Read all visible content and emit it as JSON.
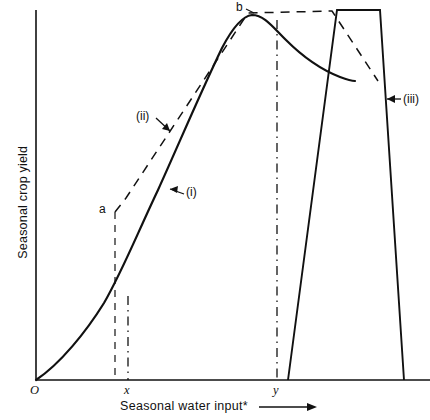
{
  "chart_data": {
    "type": "line",
    "title": "",
    "xlabel": "Seasonal water input*",
    "ylabel": "Seasonal crop yield",
    "grid": false,
    "legend": "none",
    "axes": {
      "origin_label": "O",
      "x_ticks": [
        "x",
        "y"
      ],
      "y_ticks": [],
      "xlim": [
        0,
        1
      ],
      "ylim": [
        0,
        1
      ],
      "x_arrow": true
    },
    "annotations": [
      {
        "id": "a",
        "label": "a",
        "note": "start of linear segment of curve (ii)"
      },
      {
        "id": "b",
        "label": "b",
        "note": "start of plateau of curve (ii)"
      },
      {
        "id": "i",
        "label": "(i)",
        "note": "solid sigmoid production function"
      },
      {
        "id": "ii",
        "label": "(ii)",
        "note": "dashed piecewise-linear approximation"
      },
      {
        "id": "iii",
        "label": "(iii)",
        "note": "solid trapezoidal block function"
      }
    ],
    "series": [
      {
        "name": "(i)",
        "style": "solid",
        "kind": "curve",
        "points": [
          [
            36,
            380
          ],
          [
            52,
            367
          ],
          [
            68,
            352
          ],
          [
            84,
            334
          ],
          [
            98,
            315
          ],
          [
            112,
            292
          ],
          [
            124,
            269
          ],
          [
            136,
            243
          ],
          [
            148,
            215
          ],
          [
            160,
            186
          ],
          [
            172,
            157
          ],
          [
            184,
            125
          ],
          [
            196,
            96
          ],
          [
            208,
            70
          ],
          [
            220,
            48
          ],
          [
            232,
            30
          ],
          [
            244,
            18
          ],
          [
            252,
            15
          ],
          [
            262,
            17
          ],
          [
            272,
            24
          ],
          [
            284,
            36
          ],
          [
            296,
            50
          ],
          [
            308,
            62
          ],
          [
            320,
            70
          ],
          [
            334,
            76
          ],
          [
            346,
            80
          ],
          [
            355,
            81
          ]
        ]
      },
      {
        "name": "(ii)",
        "style": "dashed",
        "kind": "polyline",
        "points": [
          [
            115,
            212
          ],
          [
            126,
            198
          ],
          [
            248,
            13
          ],
          [
            332,
            11
          ],
          [
            378,
            81
          ]
        ]
      },
      {
        "name": "(iii)",
        "style": "solid",
        "kind": "polyline",
        "points": [
          [
            288,
            380
          ],
          [
            337,
            10
          ],
          [
            380,
            10
          ],
          [
            404,
            380
          ]
        ]
      }
    ],
    "vertical_lines": [
      {
        "id": "a-drop",
        "x": 115,
        "y_top": 212,
        "y_bottom": 380,
        "style": "dashed"
      },
      {
        "id": "x-marker",
        "x": 128,
        "y_top": 296,
        "y_bottom": 380,
        "style": "dash-dot"
      },
      {
        "id": "y-marker",
        "x": 277,
        "y_top": 20,
        "y_bottom": 380,
        "style": "dash-dot"
      }
    ]
  },
  "colors": {
    "ink": "#111111",
    "background": "#ffffff"
  },
  "labels": {
    "y_axis": "Seasonal crop yield",
    "x_axis": "Seasonal water input*",
    "tick_origin": "O",
    "tick_x": "x",
    "tick_y": "y",
    "point_a": "a",
    "point_b": "b",
    "curve_i": "(i)",
    "curve_ii": "(ii)",
    "curve_iii": "(iii)"
  }
}
